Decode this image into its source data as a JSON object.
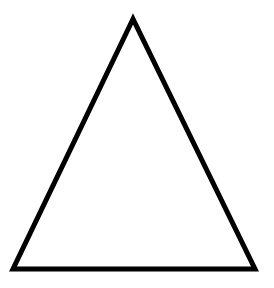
{
  "diagram": {
    "shape": "triangle",
    "stroke_color": "#000000",
    "fill_color": "#ffffff",
    "background": "#ffffff",
    "stroke_width": 5,
    "vertices": {
      "apex": [
        133,
        19
      ],
      "bottom_left": [
        13,
        269
      ],
      "bottom_right": [
        255,
        269
      ]
    }
  }
}
